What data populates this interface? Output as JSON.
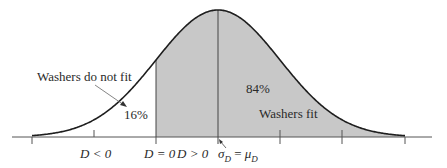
{
  "figure": {
    "type": "normal-distribution-diagram",
    "colors": {
      "curve": "#1e1e1e",
      "shade": "#c8c8c8",
      "axis": "#555555",
      "text": "#2a2a2a"
    }
  },
  "labels": {
    "not_fit_title": "Washers do not fit",
    "not_fit_percent": "16%",
    "fit_percent": "84%",
    "fit_title": "Washers fit"
  },
  "axis_labels": {
    "d_less": "D < 0",
    "d_zero": "D = 0",
    "d_greater": "D > 0",
    "sigma_mu": "σ_D = μ_D",
    "sigma_text": "σ",
    "sigma_sub": "D",
    "eq": " = ",
    "mu_text": "μ",
    "mu_sub": "D"
  },
  "chart_data": {
    "type": "area",
    "title": "",
    "distribution": "normal",
    "mean_position": "center",
    "threshold": "D = 0 (one standard deviation below mean)",
    "regions": [
      {
        "name": "Washers do not fit",
        "condition": "D < 0",
        "percent": 16,
        "shaded": false
      },
      {
        "name": "Washers fit",
        "condition": "D > 0",
        "percent": 84,
        "shaded": true
      }
    ],
    "annotations": [
      "Washers do not fit",
      "16%",
      "84%",
      "Washers fit",
      "D < 0",
      "D = 0",
      "D > 0",
      "σ_D = μ_D"
    ],
    "tick_count": 7,
    "grid": false
  }
}
